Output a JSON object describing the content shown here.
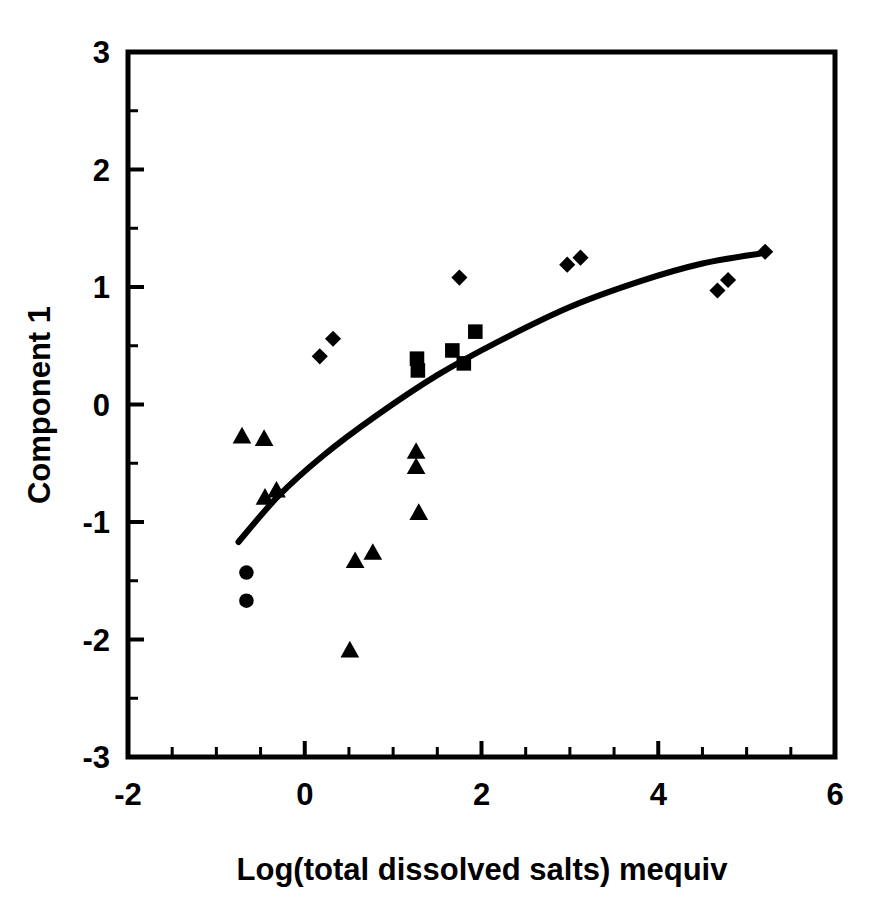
{
  "chart_data": {
    "type": "scatter",
    "title": "",
    "xlabel": "Log(total dissolved salts) mequiv",
    "ylabel": "Component 1",
    "xlim": [
      -2,
      6
    ],
    "ylim": [
      -3,
      3
    ],
    "x_major_ticks": [
      -2,
      0,
      2,
      4,
      6
    ],
    "x_tick_labels": [
      "-2",
      "0",
      "2",
      "4",
      "6"
    ],
    "x_minor_step": 0.5,
    "y_major_ticks": [
      3,
      2,
      1,
      0,
      -1,
      -2,
      -3
    ],
    "y_tick_labels": [
      "3",
      "2",
      "1",
      "0",
      "-1",
      "-2",
      "-3"
    ],
    "y_minor_step": 0.5,
    "grid": false,
    "legend": "none",
    "marker_color": "#000000",
    "series": [
      {
        "name": "diamonds",
        "marker": "diamond",
        "points": [
          [
            0.17,
            0.41
          ],
          [
            0.32,
            0.56
          ],
          [
            1.75,
            1.08
          ],
          [
            2.97,
            1.19
          ],
          [
            3.12,
            1.25
          ],
          [
            4.67,
            0.97
          ],
          [
            4.79,
            1.06
          ],
          [
            5.21,
            1.3
          ]
        ]
      },
      {
        "name": "squares",
        "marker": "square",
        "points": [
          [
            1.27,
            0.39
          ],
          [
            1.28,
            0.29
          ],
          [
            1.67,
            0.46
          ],
          [
            1.93,
            0.62
          ],
          [
            1.8,
            0.35
          ]
        ]
      },
      {
        "name": "triangles",
        "marker": "triangle",
        "points": [
          [
            -0.71,
            -0.27
          ],
          [
            -0.46,
            -0.29
          ],
          [
            -0.45,
            -0.79
          ],
          [
            -0.32,
            -0.73
          ],
          [
            1.26,
            -0.4
          ],
          [
            1.26,
            -0.53
          ],
          [
            1.29,
            -0.92
          ],
          [
            0.57,
            -1.33
          ],
          [
            0.77,
            -1.26
          ],
          [
            0.51,
            -2.09
          ]
        ]
      },
      {
        "name": "circles",
        "marker": "circle",
        "points": [
          [
            -0.66,
            -1.43
          ],
          [
            -0.66,
            -1.67
          ]
        ]
      }
    ],
    "fit_curve": {
      "name": "fitted-trend",
      "style": "solid",
      "points": [
        [
          -0.75,
          -1.17
        ],
        [
          -0.3,
          -0.78
        ],
        [
          0.2,
          -0.44
        ],
        [
          0.8,
          -0.1
        ],
        [
          1.5,
          0.25
        ],
        [
          2.2,
          0.54
        ],
        [
          3.0,
          0.83
        ],
        [
          3.8,
          1.05
        ],
        [
          4.5,
          1.2
        ],
        [
          5.2,
          1.29
        ]
      ]
    }
  }
}
